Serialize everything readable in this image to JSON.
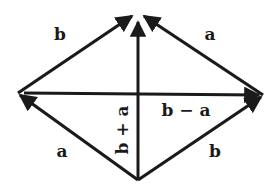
{
  "diagram": {
    "stroke_color": "#1a1a1a",
    "background": "#ffffff",
    "points": {
      "top": [
        138,
        14
      ],
      "left": [
        18,
        93
      ],
      "right": [
        263,
        95
      ],
      "bottom": [
        138,
        180
      ]
    },
    "vectors": [
      {
        "id": "b-top-left",
        "from": "left",
        "to": "top",
        "label": "b"
      },
      {
        "id": "a-top-right",
        "from": "right",
        "to": "top",
        "label": "a"
      },
      {
        "id": "a-bottom-left",
        "from": "bottom",
        "to": "left",
        "label": "a"
      },
      {
        "id": "b-bottom-right",
        "from": "bottom",
        "to": "right",
        "label": "b"
      },
      {
        "id": "sum",
        "from": "bottom",
        "to": "top",
        "label": "b + a"
      },
      {
        "id": "diff",
        "from": "left",
        "to": "right",
        "label": "b − a"
      }
    ],
    "labels": {
      "b_upper_left": "b",
      "a_upper_right": "a",
      "a_lower_left": "a",
      "b_lower_right": "b",
      "sum": "b + a",
      "difference": "b − a"
    }
  }
}
